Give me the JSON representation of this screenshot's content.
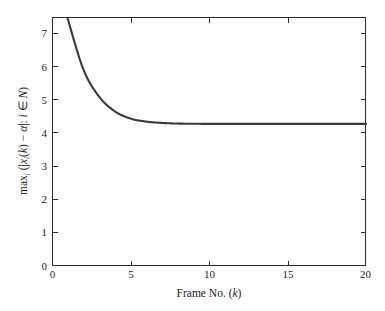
{
  "figure": {
    "background_color": "#ffffff",
    "frame_color": "#2b2b2b"
  },
  "chart_data": {
    "type": "line",
    "title": "",
    "subtitle": "",
    "xlabel": "Frame No. (k)",
    "ylabel": "max_i (|x_i(k) - a| : i in N)",
    "xlabel_parts": {
      "prefix": "Frame No. (",
      "variable": "k",
      "suffix": ")"
    },
    "ylabel_parts": {
      "max": "max",
      "max_sub": "i",
      "open_paren": "(",
      "abs_open": "|",
      "x": "x",
      "x_sub": "i",
      "k_open": "(",
      "k": "k",
      "k_close": ")",
      "minus": "−",
      "alpha": "α",
      "abs_close": "|",
      "colon": ":",
      "i": "i",
      "in": "∈",
      "set": "Ν",
      "close_paren": ")"
    },
    "xlim": [
      0,
      20
    ],
    "ylim": [
      0,
      7.5
    ],
    "xticks": [
      0,
      5,
      10,
      15,
      20
    ],
    "xtick_labels": [
      "0",
      "5",
      "10",
      "15",
      "20"
    ],
    "yticks": [
      0,
      1,
      2,
      3,
      4,
      5,
      6,
      7
    ],
    "ytick_labels": [
      "0",
      "1",
      "2",
      "3",
      "4",
      "5",
      "6",
      "7"
    ],
    "grid": false,
    "legend": null,
    "legend_position": "none",
    "series": [
      {
        "name": "max consensus error",
        "color": "#3a3a3a",
        "line_width": 2.1,
        "x": [
          1,
          2,
          3,
          4,
          5,
          6,
          7,
          8,
          9,
          10,
          11,
          12,
          13,
          14,
          15,
          16,
          17,
          18,
          19,
          20
        ],
        "values": [
          7.45,
          5.92,
          5.1,
          4.66,
          4.44,
          4.35,
          4.31,
          4.29,
          4.285,
          4.28,
          4.28,
          4.28,
          4.28,
          4.28,
          4.28,
          4.28,
          4.28,
          4.28,
          4.28,
          4.28
        ]
      }
    ],
    "asymptote": 4.28,
    "start_value": 7.45
  },
  "layout": {
    "plot_left": 52,
    "plot_right": 366,
    "plot_top": 17,
    "plot_bottom": 266
  }
}
